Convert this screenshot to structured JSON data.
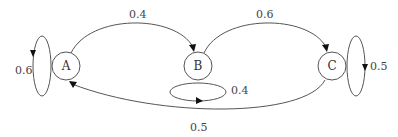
{
  "diagram": {
    "type": "state-transition-diagram",
    "nodes": [
      {
        "id": "A",
        "label": "A"
      },
      {
        "id": "B",
        "label": "B"
      },
      {
        "id": "C",
        "label": "C"
      }
    ],
    "edges": [
      {
        "from": "A",
        "to": "A",
        "label": "0.6"
      },
      {
        "from": "A",
        "to": "B",
        "label": "0.4"
      },
      {
        "from": "B",
        "to": "C",
        "label": "0.6"
      },
      {
        "from": "B",
        "to": "B",
        "label": "0.4"
      },
      {
        "from": "C",
        "to": "C",
        "label": "0.5"
      },
      {
        "from": "C",
        "to": "A",
        "label": "0.5"
      }
    ],
    "colors": {
      "stroke": "#555555",
      "arrow": "#111111",
      "text": "#333333"
    }
  }
}
